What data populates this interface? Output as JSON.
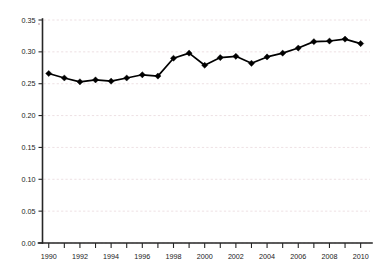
{
  "chart_data": {
    "type": "line",
    "title": "",
    "subtitle": "",
    "xlabel": "",
    "ylabel": "",
    "xlim": [
      1989.6,
      2010.6
    ],
    "ylim": [
      0.0,
      0.35
    ],
    "grid": true,
    "legend": false,
    "legend_position": "none",
    "y_ticks": [
      0.0,
      0.05,
      0.1,
      0.15,
      0.2,
      0.25,
      0.3,
      0.35
    ],
    "y_tick_labels": [
      "0.00",
      "0.05",
      "0.10",
      "0.15",
      "0.20",
      "0.25",
      "0.30",
      "0.35"
    ],
    "x_ticks": [
      1990,
      1991,
      1992,
      1993,
      1994,
      1995,
      1996,
      1997,
      1998,
      1999,
      2000,
      2001,
      2002,
      2003,
      2004,
      2005,
      2006,
      2007,
      2008,
      2009,
      2010
    ],
    "x_tick_labels": [
      "1990",
      "",
      "1992",
      "",
      "1994",
      "",
      "1996",
      "",
      "1998",
      "",
      "2000",
      "",
      "2002",
      "",
      "2004",
      "",
      "2006",
      "",
      "2008",
      "",
      "2010"
    ],
    "x_labels_shown": [
      "1990",
      "1992",
      "1994",
      "1996",
      "1998",
      "2000",
      "2002",
      "2004",
      "2006",
      "2008",
      "2010"
    ],
    "marker": "diamond",
    "line_color": "#000000",
    "marker_color": "#000000",
    "grid_color": "#e9d8dc",
    "axis_color": "#262626",
    "background": "#ffffff",
    "x": [
      1990,
      1991,
      1992,
      1993,
      1994,
      1995,
      1996,
      1997,
      1998,
      1999,
      2000,
      2001,
      2002,
      2003,
      2004,
      2005,
      2006,
      2007,
      2008,
      2009,
      2010
    ],
    "values": [
      0.266,
      0.259,
      0.253,
      0.256,
      0.254,
      0.259,
      0.264,
      0.262,
      0.29,
      0.298,
      0.279,
      0.291,
      0.293,
      0.282,
      0.292,
      0.298,
      0.306,
      0.316,
      0.317,
      0.32,
      0.313
    ],
    "series": [
      {
        "name": "series-1",
        "values": [
          0.266,
          0.259,
          0.253,
          0.256,
          0.254,
          0.259,
          0.264,
          0.262,
          0.29,
          0.298,
          0.279,
          0.291,
          0.293,
          0.282,
          0.292,
          0.298,
          0.306,
          0.316,
          0.317,
          0.32,
          0.313
        ]
      }
    ]
  }
}
